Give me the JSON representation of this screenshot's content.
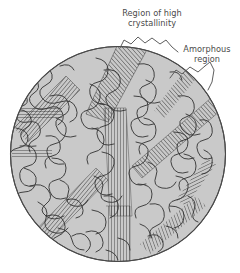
{
  "figure": {
    "title_hidden": "Semicrystalline polymer microstructure (fringed-micelle model)",
    "annotations": {
      "crystalline": {
        "line1": "Region of high",
        "line2": "crystallinity"
      },
      "amorphous": {
        "line1": "Amorphous",
        "line2": "region"
      }
    },
    "colors": {
      "background": "#ffffff",
      "disk_fill": "#c9c9c9",
      "chain_line": "#3a3a3a",
      "lamella_line": "#2e2e2e",
      "disk_outline": "#4a4a4a",
      "label_text": "#4a4a4a",
      "leader_line": "#555555"
    },
    "geometry": {
      "disk_center_x": 118,
      "disk_center_y": 154,
      "disk_radius": 108,
      "canvas_width": 240,
      "canvas_height": 273
    },
    "elements": {
      "amorphous_chain_count": 46,
      "crystalline_bundle_count": 7,
      "lamella_line_spacing_px": 2.2
    }
  }
}
